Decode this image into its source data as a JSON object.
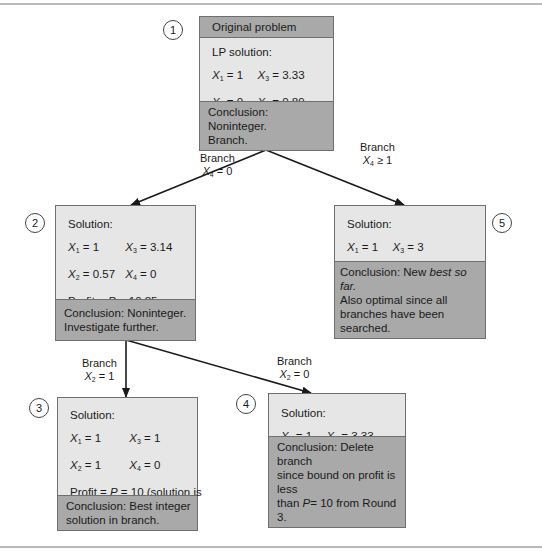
{
  "colors": {
    "box_body": "#e6e6e6",
    "box_header": "#a9a9a9",
    "box_border": "#6f6f6f",
    "edge": "#1a1a1a"
  },
  "nodes": [
    {
      "id": "1",
      "number": "1",
      "header": "Original problem",
      "solution_label": "LP solution:",
      "x1": "1",
      "x2": "0",
      "x3": "3.33",
      "x4": "0.89",
      "profit_prefix": "Profit = ",
      "profit_var": "P",
      "profit_value": " = 11.11",
      "conclusion": [
        "Conclusion: Noninteger.",
        "Branch."
      ]
    },
    {
      "id": "2",
      "number": "2",
      "solution_label": "Solution:",
      "x1": "1",
      "x2": "0.57",
      "x3": "3.14",
      "x4": "0",
      "profit_prefix": "Profit = ",
      "profit_var": "P",
      "profit_value": " = 10.85",
      "conclusion": [
        "Conclusion: Noninteger.",
        "Investigate further."
      ]
    },
    {
      "id": "3",
      "number": "3",
      "solution_label": "Solution:",
      "x1": "1",
      "x2": "1",
      "x3": "1",
      "x4": "0",
      "profit_prefix": "Profit = ",
      "profit_var": "P",
      "profit_value": " = 10 (solution is",
      "profit_cont": "integer)",
      "conclusion": [
        "Conclusion: Best integer",
        "solution in branch."
      ]
    },
    {
      "id": "4",
      "number": "4",
      "solution_label": "Solution:",
      "x1": "1",
      "x2": "0",
      "x3": "3.33",
      "x4": "0",
      "profit_prefix": "Profit = ",
      "profit_var": "P",
      "profit_value": " = 9.33",
      "conclusion_parts": {
        "line1": "Conclusion: Delete branch",
        "line2": "since bound on profit is less",
        "line3_pre": "than ",
        "line3_var": "P",
        "line3_post": "= 10 from Round 3."
      }
    },
    {
      "id": "5",
      "number": "5",
      "solution_label": "Solution:",
      "x1": "1",
      "x2": "0",
      "x3": "3",
      "x4": "1",
      "profit_prefix": "Profit = ",
      "profit_var": "P",
      "profit_value": " = 11 (solution is",
      "profit_cont": "integer)",
      "conclusion_parts": {
        "line1_pre": "Conclusion: New ",
        "line1_em": "best so far.",
        "line2": "Also optimal since all",
        "line3": "branches have been searched."
      }
    }
  ],
  "edges": [
    {
      "from": "1",
      "to": "2",
      "label_word": "Branch",
      "label_var": "X",
      "label_sub": "4",
      "label_rel": " = 0"
    },
    {
      "from": "1",
      "to": "5",
      "label_word": "Branch",
      "label_var": "X",
      "label_sub": "4",
      "label_rel": " ≥ 1"
    },
    {
      "from": "2",
      "to": "3",
      "label_word": "Branch",
      "label_var": "X",
      "label_sub": "2",
      "label_rel": " = 1"
    },
    {
      "from": "2",
      "to": "4",
      "label_word": "Branch",
      "label_var": "X",
      "label_sub": "2",
      "label_rel": " = 0"
    }
  ],
  "var_labels": {
    "x1": "1",
    "x2": "2",
    "x3": "3",
    "x4": "4",
    "sym": "X",
    "eq": " = "
  }
}
